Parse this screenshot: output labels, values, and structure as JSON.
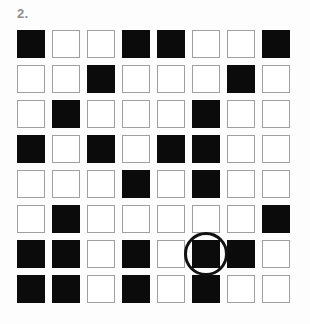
{
  "figure": {
    "label": "2.",
    "bottom_caption": "",
    "colors": {
      "filled": "#0b0b0b",
      "empty": "#ffffff",
      "cell_border": "#a0a0a0",
      "label_text": "#8d8d8d",
      "highlight_stroke": "#111111",
      "background": "#fdfdfd"
    },
    "grid": {
      "rows": 8,
      "columns": 8,
      "cell_size_px": 28,
      "gap_px": 7,
      "legend": {
        "1": "filled",
        "0": "empty"
      },
      "matrix": [
        [
          1,
          0,
          0,
          1,
          1,
          0,
          0,
          1
        ],
        [
          0,
          0,
          1,
          0,
          0,
          0,
          1,
          0
        ],
        [
          0,
          1,
          0,
          0,
          0,
          1,
          0,
          0
        ],
        [
          1,
          0,
          1,
          0,
          1,
          1,
          0,
          0
        ],
        [
          0,
          0,
          0,
          1,
          0,
          1,
          0,
          0
        ],
        [
          0,
          1,
          0,
          0,
          0,
          0,
          0,
          1
        ],
        [
          1,
          1,
          0,
          1,
          0,
          1,
          1,
          0
        ],
        [
          1,
          1,
          0,
          1,
          0,
          1,
          0,
          0
        ]
      ]
    },
    "highlight": {
      "shape": "circle",
      "row": 7,
      "column": 6,
      "diameter_px": 44,
      "stroke_width_px": 3
    }
  }
}
